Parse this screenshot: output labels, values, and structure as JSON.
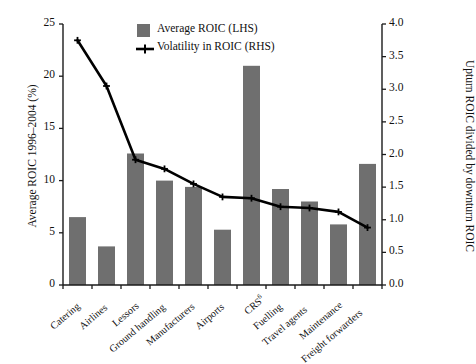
{
  "chart_data": {
    "type": "bar",
    "title": "",
    "categories": [
      "Catering",
      "Airlines",
      "Lessors",
      "Ground handling",
      "Manufacturers",
      "Airports",
      "CRS",
      "Fuelling",
      "Travel agents",
      "Maintenance",
      "Freight forwarders"
    ],
    "category_footnotes": {
      "CRS": "6"
    },
    "series": [
      {
        "name": "Average ROIC (LHS)",
        "type": "bar",
        "axis": "left",
        "color": "#6f6f6f",
        "values": [
          6.5,
          3.7,
          12.6,
          10.0,
          9.4,
          5.3,
          21.0,
          9.2,
          8.0,
          5.8,
          11.6
        ]
      },
      {
        "name": "Volatility in ROIC (RHS)",
        "type": "line",
        "axis": "right",
        "color": "#000000",
        "values": [
          3.75,
          3.05,
          1.92,
          1.78,
          1.55,
          1.35,
          1.33,
          1.2,
          1.18,
          1.12,
          0.88
        ]
      }
    ],
    "xlabel": "",
    "ylabel": "Average ROIC 1996–2004 (%)",
    "ylabel_right": "Upturn ROIC divided by downturn ROIC",
    "ylim": [
      0,
      25
    ],
    "ylim_right": [
      0,
      4.0
    ],
    "yticks": [
      "0",
      "5",
      "10",
      "15",
      "20",
      "25"
    ],
    "yticks_right": [
      "0.0",
      "0.5",
      "1.0",
      "1.5",
      "2.0",
      "2.5",
      "3.0",
      "3.5",
      "4.0"
    ],
    "grid": false,
    "legend_position": "top-center"
  },
  "legend": {
    "items": [
      {
        "label": "Average ROIC (LHS)",
        "marker": "square-swatch"
      },
      {
        "label": "Volatility in ROIC (RHS)",
        "marker": "line-with-plus-marker"
      }
    ]
  },
  "axes": {
    "left_title": "Average ROIC 1996–2004 (%)",
    "right_title": "Upturn ROIC divided by downturn ROIC"
  }
}
